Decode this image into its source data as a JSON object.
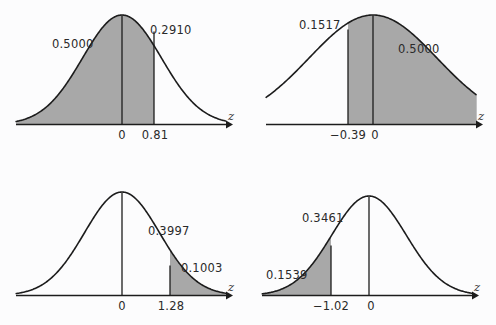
{
  "figure": {
    "background_color": "#fcfcfd",
    "shade_color": "#a8a8a8",
    "curve_color": "#1c1c1c",
    "axis_symbol": "z"
  },
  "chart_data": {
    "type": "area",
    "xlabel": "z",
    "ylabel": "",
    "grid": false,
    "legend": false,
    "distribution": "standard normal",
    "panels": [
      {
        "id": "panel-top-left",
        "position": "top-left",
        "z_ticks": [
          "0",
          "0.81"
        ],
        "z_values": [
          0,
          0.81
        ],
        "shaded_interval": [
          "-inf",
          0.81
        ],
        "area_labels": [
          {
            "text": "0.5000",
            "region": "left-of-zero"
          },
          {
            "text": "0.2910",
            "region": "zero-to-0.81"
          }
        ],
        "axis_label": "z"
      },
      {
        "id": "panel-top-right",
        "position": "top-right",
        "z_ticks": [
          "−0.39",
          "0"
        ],
        "z_values": [
          -0.39,
          0
        ],
        "shaded_interval": [
          -0.39,
          "+inf"
        ],
        "area_labels": [
          {
            "text": "0.1517",
            "region": "-0.39-to-zero"
          },
          {
            "text": "0.5000",
            "region": "right-of-zero"
          }
        ],
        "axis_label": "z"
      },
      {
        "id": "panel-bottom-left",
        "position": "bottom-left",
        "z_ticks": [
          "0",
          "1.28"
        ],
        "z_values": [
          0,
          1.28
        ],
        "shaded_interval": [
          1.28,
          "+inf"
        ],
        "area_labels": [
          {
            "text": "0.3997",
            "region": "zero-to-1.28"
          },
          {
            "text": "0.1003",
            "region": "right-of-1.28"
          }
        ],
        "axis_label": "z"
      },
      {
        "id": "panel-bottom-right",
        "position": "bottom-right",
        "z_ticks": [
          "−1.02",
          "0"
        ],
        "z_values": [
          -1.02,
          0
        ],
        "shaded_interval": [
          "-inf",
          -1.02
        ],
        "area_labels": [
          {
            "text": "0.3461",
            "region": "-1.02-to-zero"
          },
          {
            "text": "0.1539",
            "region": "left-of--1.02"
          }
        ],
        "axis_label": "z"
      }
    ]
  },
  "panel1": {
    "label_left": "0.5000",
    "label_right": "0.2910",
    "tick_zero": "0",
    "tick_z": "0.81",
    "axis": "z"
  },
  "panel2": {
    "label_left": "0.1517",
    "label_right": "0.5000",
    "tick_z": "−0.39",
    "tick_zero": "0",
    "axis": "z"
  },
  "panel3": {
    "label_left": "0.3997",
    "label_right": "0.1003",
    "tick_zero": "0",
    "tick_z": "1.28",
    "axis": "z"
  },
  "panel4": {
    "label_left": "0.3461",
    "label_right": "0.1539",
    "tick_z": "−1.02",
    "tick_zero": "0",
    "axis": "z"
  }
}
